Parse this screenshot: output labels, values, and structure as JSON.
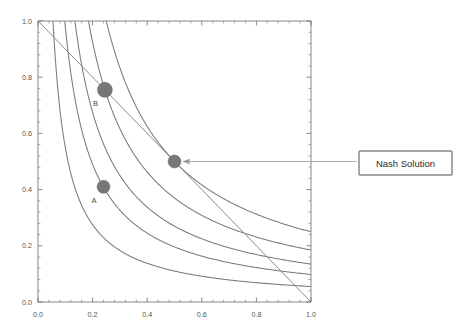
{
  "chart_data": {
    "type": "line",
    "title": "",
    "xlabel": "",
    "ylabel": "",
    "xlim": [
      0.0,
      1.0
    ],
    "ylim": [
      0.0,
      1.0
    ],
    "grid": false,
    "legend_position": "none",
    "x_ticks": [
      "0.0",
      "0.2",
      "0.4",
      "0.6",
      "0.8",
      "1.0"
    ],
    "x_tick_values": [
      0.0,
      0.2,
      0.4,
      0.6,
      0.8,
      1.0
    ],
    "y_ticks": [
      "0.0",
      "0.2",
      "0.4",
      "0.6",
      "0.8",
      "1.0"
    ],
    "y_tick_values": [
      0.0,
      0.2,
      0.4,
      0.6,
      0.8,
      1.0
    ],
    "minor_ticks_per_interval": 4,
    "series": [
      {
        "name": "nash-product-curve-1",
        "kind": "hyperbola",
        "equation": "x*y = 0.055",
        "k": 0.055,
        "color": "#7a7a7a"
      },
      {
        "name": "nash-product-curve-2",
        "kind": "hyperbola",
        "equation": "x*y = 0.098",
        "k": 0.098,
        "color": "#7a7a7a"
      },
      {
        "name": "nash-product-curve-3",
        "kind": "hyperbola",
        "equation": "x*y = 0.135",
        "k": 0.135,
        "color": "#7a7a7a"
      },
      {
        "name": "nash-product-curve-4",
        "kind": "hyperbola",
        "equation": "x*y = 0.185",
        "k": 0.185,
        "color": "#7a7a7a"
      },
      {
        "name": "nash-product-curve-5",
        "kind": "hyperbola",
        "equation": "x*y = 0.25",
        "k": 0.25,
        "color": "#7a7a7a"
      },
      {
        "name": "bargaining-frontier",
        "kind": "line",
        "points": [
          [
            0.0,
            1.0
          ],
          [
            1.0,
            0.0
          ]
        ],
        "color": "#8a8a8a"
      }
    ],
    "points": [
      {
        "label": "A",
        "x": 0.24,
        "y": 0.41,
        "color": "#777777",
        "radius_px": 6.5
      },
      {
        "label": "B",
        "x": 0.245,
        "y": 0.755,
        "color": "#777777",
        "radius_px": 7.5
      },
      {
        "label": "",
        "x": 0.5,
        "y": 0.5,
        "color": "#777777",
        "radius_px": 6.5
      }
    ],
    "annotations": [
      {
        "text": "Nash Solution",
        "target_x": 0.5,
        "target_y": 0.5,
        "boxed": true
      }
    ]
  },
  "labels": {
    "point_a": "A",
    "point_b": "B",
    "nash_annotation": "Nash Solution"
  }
}
